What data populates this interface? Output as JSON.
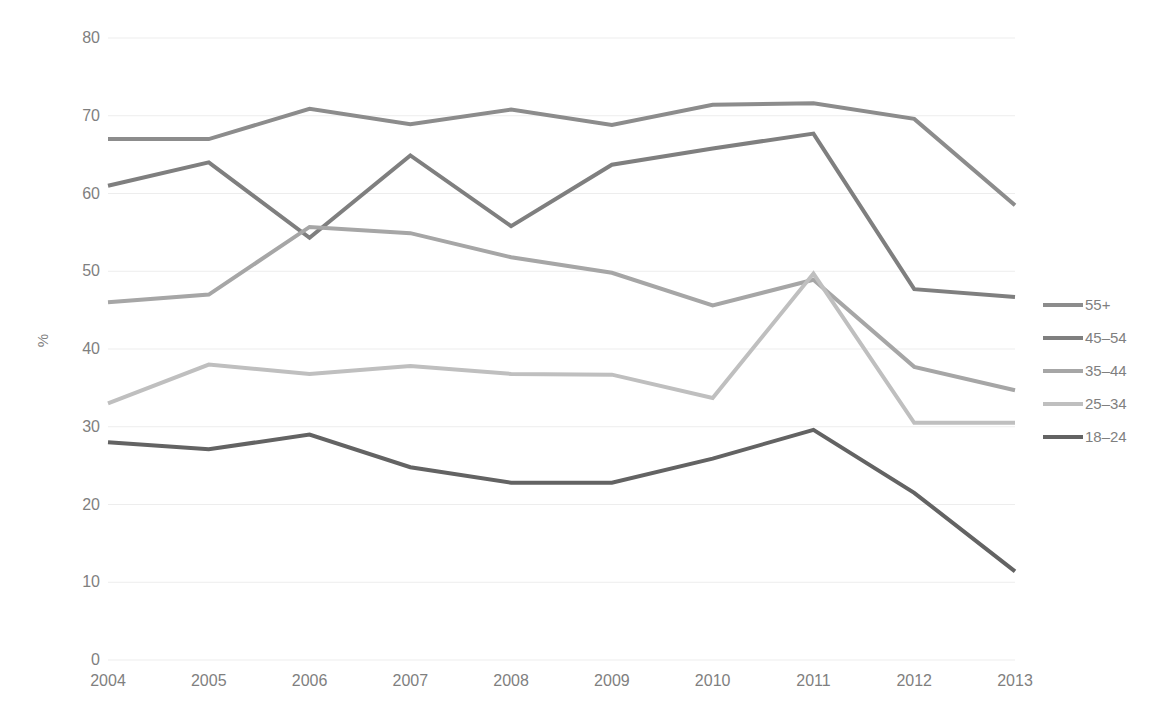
{
  "chart_data": {
    "type": "line",
    "title": "",
    "subtitle": "",
    "xlabel": "",
    "ylabel": "%",
    "categories": [
      "2004",
      "2005",
      "2006",
      "2007",
      "2008",
      "2009",
      "2010",
      "2011",
      "2012",
      "2013"
    ],
    "x": [
      2004,
      2005,
      2006,
      2007,
      2008,
      2009,
      2010,
      2011,
      2012,
      2013
    ],
    "ylim": [
      0,
      80
    ],
    "yticks": [
      0,
      10,
      20,
      30,
      40,
      50,
      60,
      70,
      80
    ],
    "ytick_labels": [
      "0",
      "10",
      "20",
      "30",
      "40",
      "50",
      "60",
      "70",
      "80"
    ],
    "grid": "horizontal",
    "legend_position": "right",
    "series": [
      {
        "name": "55+",
        "color": "#8c8c8c",
        "values": [
          67.0,
          67.0,
          70.9,
          68.9,
          70.8,
          68.8,
          71.4,
          71.6,
          69.6,
          58.5
        ]
      },
      {
        "name": "45–54",
        "color": "#7f7f7f",
        "values": [
          61.0,
          64.0,
          54.3,
          64.9,
          55.8,
          63.7,
          65.8,
          67.7,
          47.7,
          46.7
        ]
      },
      {
        "name": "35–44",
        "color": "#a6a6a6",
        "values": [
          46.0,
          47.0,
          55.7,
          54.9,
          51.8,
          49.8,
          45.6,
          48.9,
          37.7,
          34.7
        ]
      },
      {
        "name": "25–34",
        "color": "#bfbfbf",
        "values": [
          33.0,
          38.0,
          36.8,
          37.8,
          36.8,
          36.7,
          33.7,
          49.7,
          30.5,
          30.5
        ]
      },
      {
        "name": "18–24",
        "color": "#636363",
        "values": [
          28.0,
          27.1,
          29.0,
          24.8,
          22.8,
          22.8,
          25.9,
          29.6,
          21.5,
          11.4
        ]
      }
    ]
  },
  "legend": {
    "entries": [
      {
        "label": "55+"
      },
      {
        "label": "45–54"
      },
      {
        "label": "35–44"
      },
      {
        "label": "25–34"
      },
      {
        "label": "18–24"
      }
    ]
  },
  "axes": {
    "y_axis_title": "%",
    "y_tick_labels": [
      "80",
      "70",
      "60",
      "50",
      "40",
      "30",
      "20",
      "10",
      "0"
    ],
    "x_tick_labels": [
      "2004",
      "2005",
      "2006",
      "2007",
      "2008",
      "2009",
      "2010",
      "2011",
      "2012",
      "2013"
    ]
  },
  "style": {
    "gridline_color": "#ededed",
    "tick_text_color": "#7f7f7f",
    "background": "#ffffff",
    "line_width": 4
  }
}
